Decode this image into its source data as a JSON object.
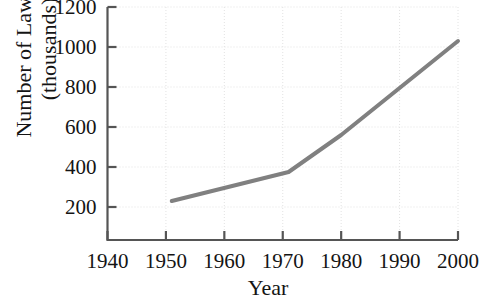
{
  "chart_data": {
    "type": "line",
    "title": "",
    "subtitle": "",
    "xlabel": "Year",
    "ylabel": "Number of Lawyers (thousands)",
    "ylabel_line1": "Number of Lawyers",
    "ylabel_line2": "(thousands)",
    "xlim": [
      1940,
      2000
    ],
    "ylim": [
      0,
      1200
    ],
    "xticks": [
      1940,
      1950,
      1960,
      1970,
      1980,
      1990,
      2000
    ],
    "xtick_labels": [
      "1940",
      "1950",
      "1960",
      "1970",
      "1980",
      "1990",
      "2000"
    ],
    "yticks": [
      200,
      400,
      600,
      800,
      1000,
      1200
    ],
    "ytick_labels": [
      "200",
      "400",
      "600",
      "800",
      "1000",
      "1200"
    ],
    "grid": true,
    "grid_style": "dotted",
    "grid_color": "#e2e2e2",
    "legend": false,
    "legend_position": "none",
    "axis_color": "#555555",
    "line_color": "#808080",
    "line_width": 4,
    "series": [
      {
        "name": "Number of Lawyers",
        "x": [
          1951,
          1971,
          1980,
          2000
        ],
        "values": [
          230,
          375,
          560,
          1030
        ]
      }
    ]
  }
}
